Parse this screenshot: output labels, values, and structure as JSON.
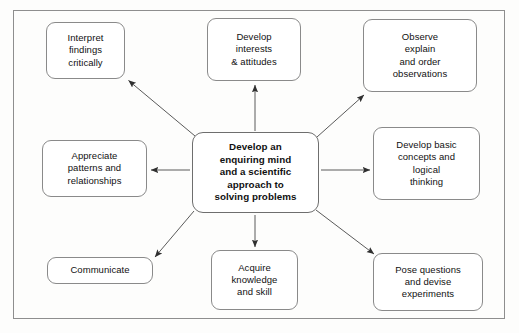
{
  "diagram": {
    "title": "Develop an enquiring mind and a scientific approach to solving problems",
    "center": {
      "id": "center-node",
      "text": "Develop an\nenquiring mind\nand a scientific\napproach to\nsolving problems",
      "bold": true
    },
    "nodes": [
      {
        "id": "interpret-findings",
        "text": "Interpret\nfindings\ncritically",
        "position": "top-left"
      },
      {
        "id": "develop-interests",
        "text": "Develop\ninterests\n& attitudes",
        "position": "top-center"
      },
      {
        "id": "observe-explain",
        "text": "Observe\nexplain\nand order\nobservations",
        "position": "top-right"
      },
      {
        "id": "appreciate-patterns",
        "text": "Appreciate\npatterns and\nrelationships",
        "position": "middle-left"
      },
      {
        "id": "develop-concepts",
        "text": "Develop basic\nconcepts and\nlogical\nthinking",
        "position": "middle-right"
      },
      {
        "id": "communicate",
        "text": "Communicate",
        "position": "bottom-left"
      },
      {
        "id": "acquire-knowledge",
        "text": "Acquire\nknowledge\nand skill",
        "position": "bottom-center"
      },
      {
        "id": "pose-questions",
        "text": "Pose questions\nand devise\nexperiments",
        "position": "bottom-right"
      }
    ],
    "arrows": [
      {
        "from": "center-node",
        "to": "interpret-findings",
        "direction": "up-left"
      },
      {
        "from": "center-node",
        "to": "develop-interests",
        "direction": "up"
      },
      {
        "from": "center-node",
        "to": "observe-explain",
        "direction": "up-right"
      },
      {
        "from": "center-node",
        "to": "appreciate-patterns",
        "direction": "left"
      },
      {
        "from": "center-node",
        "to": "develop-concepts",
        "direction": "right"
      },
      {
        "from": "center-node",
        "to": "communicate",
        "direction": "down-left"
      },
      {
        "from": "center-node",
        "to": "acquire-knowledge",
        "direction": "down"
      },
      {
        "from": "center-node",
        "to": "pose-questions",
        "direction": "down-right"
      }
    ],
    "colors": {
      "border": "#8a8a8a",
      "frame": "#8e8e8e",
      "arrow": "#3a3a3a",
      "text": "#111111",
      "background": "#fdfdfc"
    }
  }
}
